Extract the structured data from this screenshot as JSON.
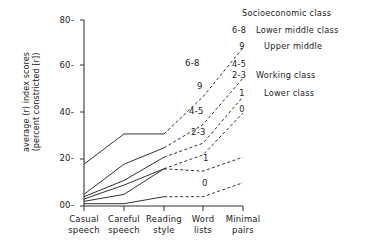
{
  "chart_data": {
    "type": "line",
    "title": "",
    "xlabel": "",
    "ylabel": "average (r) index scores (percent constricted [r])",
    "ylabel_line1": "average (r) index scores",
    "ylabel_line2": "(percent constricted [r])",
    "categories": [
      "Casual speech",
      "Careful speech",
      "Reading style",
      "Word lists",
      "Minimal pairs"
    ],
    "category_lines": [
      [
        "Casual",
        "speech"
      ],
      [
        "Careful",
        "speech"
      ],
      [
        "Reading",
        "style"
      ],
      [
        "Word",
        "lists"
      ],
      [
        "Minimal",
        "pairs"
      ]
    ],
    "ylim": [
      0,
      80
    ],
    "yticks": [
      0,
      20,
      40,
      60,
      80
    ],
    "ytick_labels": [
      "00-",
      "20-",
      "40-",
      "60-",
      "80-"
    ],
    "grid": false,
    "legend_position": "upper right outside",
    "series": [
      {
        "name": "6-8",
        "label": "6-8",
        "values": [
          18,
          31,
          31,
          47,
          68
        ],
        "solid_through": 3,
        "color": "#333333"
      },
      {
        "name": "9",
        "label": "9",
        "values": [
          5,
          18,
          25,
          35,
          55
        ],
        "solid_through": 3,
        "color": "#333333"
      },
      {
        "name": "4-5",
        "label": "4-5",
        "values": [
          4,
          11,
          21,
          27,
          47
        ],
        "solid_through": 3,
        "color": "#333333"
      },
      {
        "name": "2-3",
        "label": "2-3",
        "values": [
          3,
          9,
          16,
          22,
          40
        ],
        "solid_through": 3,
        "color": "#333333"
      },
      {
        "name": "1",
        "label": "1",
        "values": [
          2,
          5,
          16,
          15,
          21
        ],
        "solid_through": 3,
        "color": "#333333"
      },
      {
        "name": "0",
        "label": "0",
        "values": [
          1,
          1,
          4,
          4,
          10
        ],
        "solid_through": 3,
        "color": "#333333"
      }
    ],
    "annotations": [
      {
        "text": "6-8",
        "x": 185,
        "y": 65
      },
      {
        "text": "9",
        "x": 196,
        "y": 88
      },
      {
        "text": "4-5",
        "x": 190,
        "y": 113
      },
      {
        "text": "2-3",
        "x": 192,
        "y": 134
      },
      {
        "text": "1",
        "x": 202,
        "y": 160
      },
      {
        "text": "0",
        "x": 201,
        "y": 185
      }
    ]
  },
  "legend": {
    "title": "Socioeconomic class",
    "rows": [
      {
        "key": "6-8",
        "desc": "Lower middle class",
        "indent": false,
        "centered": false,
        "tight": false
      },
      {
        "key": "9",
        "desc": "Upper middle",
        "indent": true,
        "centered": true,
        "tight": false
      },
      {
        "key": "4-5",
        "desc": "",
        "indent": false,
        "centered": false,
        "tight": true
      },
      {
        "key": "2-3",
        "desc": "Working class",
        "indent": false,
        "centered": false,
        "tight": false
      },
      {
        "key": "1",
        "desc": "Lower class",
        "indent": true,
        "centered": true,
        "tight": false
      },
      {
        "key": "0",
        "desc": "",
        "indent": false,
        "centered": true,
        "tight": false
      }
    ]
  }
}
